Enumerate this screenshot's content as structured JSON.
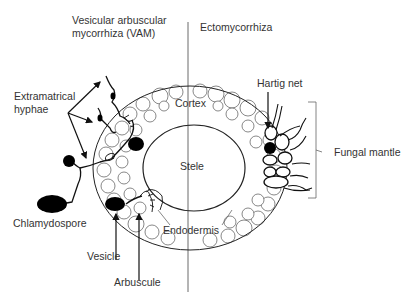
{
  "diagram": {
    "type": "mycorrhiza-root-cross-section",
    "sections": {
      "left": "Vesicular arbuscular mycorrhiza (VAM)",
      "right": "Ectomycorrhiza"
    },
    "labels": {
      "vam_title_line1": "Vesicular arbuscular",
      "vam_title_line2": "mycorrhiza (VAM)",
      "ecto_title": "Ectomycorrhiza",
      "extramatrical_line1": "Extramatrical",
      "extramatrical_line2": "hyphae",
      "cortex": "Cortex",
      "stele": "Stele",
      "endodermis": "Endodermis",
      "chlamydospore": "Chlamydospore",
      "vesicle": "Vesicle",
      "arbuscule": "Arbuscule",
      "hartig_net": "Hartig net",
      "fungal_mantle": "Fungal mantle"
    },
    "colors": {
      "stroke": "#222222",
      "label": "#333333",
      "fill_dark": "#000000",
      "background": "#ffffff"
    }
  }
}
